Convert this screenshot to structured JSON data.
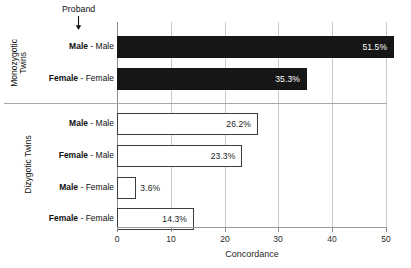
{
  "annotation": {
    "proband_label": "Proband",
    "arrow_icon": "arrow-down-icon"
  },
  "groups": [
    {
      "id": "monozygotic",
      "label_line1": "Monozygotic",
      "label_line2": "Twins"
    },
    {
      "id": "dizygotic",
      "label_line1": "Dizygotic Twins",
      "label_line2": ""
    }
  ],
  "axis": {
    "x_title": "Concordance",
    "ticks": [
      "0",
      "10",
      "20",
      "30",
      "40",
      "50"
    ]
  },
  "colors": {
    "monozygotic_bar": "#161616",
    "dizygotic_bar": "#ffffff",
    "dizygotic_bar_border": "#3d3d3d",
    "gridline": "#c9c9c9",
    "background": "#ffffff"
  },
  "chart_data": {
    "type": "bar",
    "orientation": "horizontal",
    "title": "",
    "xlabel": "Concordance",
    "ylabel": "",
    "xlim": [
      0,
      50
    ],
    "xticks": [
      0,
      10,
      20,
      30,
      40,
      50
    ],
    "grid": true,
    "legend": false,
    "categories": [
      "Monozygotic Twins: Male - Male",
      "Monozygotic Twins: Female - Female",
      "Dizygotic Twins: Male - Male",
      "Dizygotic Twins: Female - Male",
      "Dizygotic Twins: Male - Female",
      "Dizygotic Twins: Female - Female"
    ],
    "values": [
      51.5,
      35.3,
      26.2,
      23.3,
      3.6,
      14.3
    ],
    "bars": [
      {
        "group": "Monozygotic Twins",
        "proband": "Male",
        "separator": "-",
        "partner": "Male",
        "value": 51.5,
        "value_label": "51.5%",
        "style": "filled",
        "label_position": "inside"
      },
      {
        "group": "Monozygotic Twins",
        "proband": "Female",
        "separator": "-",
        "partner": "Female",
        "value": 35.3,
        "value_label": "35.3%",
        "style": "filled",
        "label_position": "inside"
      },
      {
        "group": "Dizygotic Twins",
        "proband": "Male",
        "separator": "-",
        "partner": "Male",
        "value": 26.2,
        "value_label": "26.2%",
        "style": "hollow",
        "label_position": "inside"
      },
      {
        "group": "Dizygotic Twins",
        "proband": "Female",
        "separator": "-",
        "partner": "Male",
        "value": 23.3,
        "value_label": "23.3%",
        "style": "hollow",
        "label_position": "inside"
      },
      {
        "group": "Dizygotic Twins",
        "proband": "Male",
        "separator": "-",
        "partner": "Female",
        "value": 3.6,
        "value_label": "3.6%",
        "style": "hollow",
        "label_position": "outside"
      },
      {
        "group": "Dizygotic Twins",
        "proband": "Female",
        "separator": "-",
        "partner": "Female",
        "value": 14.3,
        "value_label": "14.3%",
        "style": "hollow",
        "label_position": "inside"
      }
    ]
  }
}
